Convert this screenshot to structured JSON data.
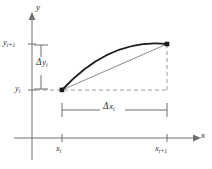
{
  "figure": {
    "background_color": "#ffffff",
    "axis_color": "#6e6e6e",
    "curve_color": "#1a1a1a",
    "chord_color": "#8c8c8c",
    "dash_color": "#9a9a9a",
    "dim_color": "#6e6e6e",
    "point_color": "#1a1a1a",
    "label_color": "#2b2b2b"
  },
  "axes": {
    "y_label": "y",
    "x_label": "x",
    "origin": {
      "x": 32,
      "y": 138
    }
  },
  "ticks": {
    "y": [
      {
        "id": "y-i-plus-1",
        "base": "y",
        "sub": "i+1",
        "value_px": 44
      },
      {
        "id": "y-i",
        "base": "y",
        "sub": "i",
        "value_px": 90
      }
    ],
    "x": [
      {
        "id": "x-i",
        "base": "x",
        "sub": "i",
        "value_px": 62
      },
      {
        "id": "x-i-plus-1",
        "base": "x",
        "sub": "i+1",
        "value_px": 167
      }
    ]
  },
  "dimensions": {
    "delta_y": {
      "symbol": "Δ",
      "base": "y",
      "sub": "i"
    },
    "delta_x": {
      "symbol": "Δ",
      "base": "x",
      "sub": "i"
    }
  },
  "points": [
    {
      "id": "left-endpoint",
      "x": 62,
      "y": 90
    },
    {
      "id": "right-endpoint",
      "x": 167,
      "y": 44
    }
  ],
  "curve": {
    "type": "concave-down-arc",
    "start": {
      "x": 62,
      "y": 90
    },
    "control": {
      "x": 110,
      "y": 38
    },
    "end": {
      "x": 167,
      "y": 44
    }
  },
  "chord": {
    "start": {
      "x": 62,
      "y": 90
    },
    "end": {
      "x": 167,
      "y": 44
    }
  }
}
